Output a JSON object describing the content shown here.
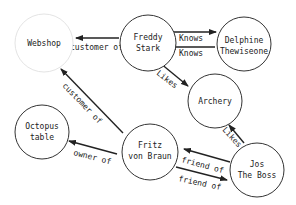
{
  "colors": {
    "background": "#ffffff",
    "node_stroke": "#333333",
    "node_stroke_faint": "#e4e4e4",
    "edge": "#222222",
    "text": "#222222"
  },
  "nodes": [
    {
      "id": "webshop",
      "lines": [
        "Webshop"
      ],
      "cx": 44,
      "cy": 43,
      "r": 29,
      "faint": true
    },
    {
      "id": "freddy",
      "lines": [
        "Freddy",
        "Stark"
      ],
      "cx": 148,
      "cy": 43,
      "r": 28
    },
    {
      "id": "delphine",
      "lines": [
        "Delphine",
        "Thewiseone"
      ],
      "cx": 222,
      "cy": 44,
      "r": 28
    },
    {
      "id": "archery",
      "lines": [
        "Archery"
      ],
      "cx": 212,
      "cy": 100,
      "r": 28
    },
    {
      "id": "octopus",
      "lines": [
        "Octopus",
        "table"
      ],
      "cx": 42,
      "cy": 132,
      "r": 27
    },
    {
      "id": "fritz",
      "lines": [
        "Fritz",
        "von Braun"
      ],
      "cx": 155,
      "cy": 152,
      "r": 28
    },
    {
      "id": "jos",
      "lines": [
        "Jos",
        "The Boss"
      ],
      "cx": 258,
      "cy": 170,
      "r": 28
    }
  ],
  "edges": [
    {
      "from": "freddy",
      "to": "webshop",
      "label": "customer of"
    },
    {
      "from": "freddy",
      "to": "delphine",
      "label": "Knows"
    },
    {
      "from": "delphine",
      "to": "freddy",
      "label": "Knows"
    },
    {
      "from": "freddy",
      "to": "archery",
      "label": "Likes"
    },
    {
      "from": "fritz",
      "to": "webshop",
      "label": "customer of"
    },
    {
      "from": "fritz",
      "to": "octopus",
      "label": "owner of"
    },
    {
      "from": "jos",
      "to": "archery",
      "label": "Likes"
    },
    {
      "from": "jos",
      "to": "fritz",
      "label": "friend of"
    },
    {
      "from": "fritz",
      "to": "jos",
      "label": "friend of"
    }
  ]
}
